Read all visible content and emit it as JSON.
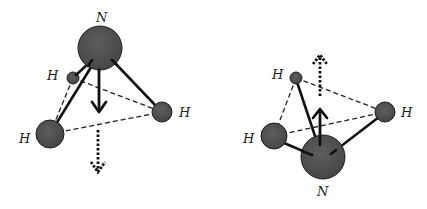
{
  "colors": {
    "atom_fill": "#505050",
    "atom_stroke": "#1e1e1e",
    "bond": "#111111",
    "background": "#ffffff"
  },
  "diagrams": [
    {
      "name": "ammonia-left",
      "nitrogen": {
        "label": "N",
        "cx": 100,
        "cy": 48,
        "r": 22,
        "label_x": 102,
        "label_y": 22
      },
      "hydrogens": [
        {
          "label": "H",
          "cx": 73,
          "cy": 78,
          "r": 6,
          "label_x": 52,
          "label_y": 80
        },
        {
          "label": "H",
          "cx": 50,
          "cy": 134,
          "r": 14,
          "label_x": 24,
          "label_y": 143
        },
        {
          "label": "H",
          "cx": 162,
          "cy": 112,
          "r": 10,
          "label_x": 180,
          "label_y": 117
        }
      ],
      "dipole_solid": {
        "direction": "down"
      },
      "dipole_dotted": {
        "direction": "down"
      }
    },
    {
      "name": "ammonia-right-inverted",
      "nitrogen": {
        "label": "N",
        "cx": 323,
        "cy": 157,
        "r": 22,
        "label_x": 320,
        "label_y": 196
      },
      "hydrogens": [
        {
          "label": "H",
          "cx": 296,
          "cy": 78,
          "r": 6,
          "label_x": 273,
          "label_y": 79
        },
        {
          "label": "H",
          "cx": 274,
          "cy": 136,
          "r": 13,
          "label_x": 248,
          "label_y": 143
        },
        {
          "label": "H",
          "cx": 385,
          "cy": 112,
          "r": 10,
          "label_x": 402,
          "label_y": 117
        }
      ],
      "dipole_solid": {
        "direction": "up"
      },
      "dipole_dotted": {
        "direction": "up"
      }
    }
  ]
}
